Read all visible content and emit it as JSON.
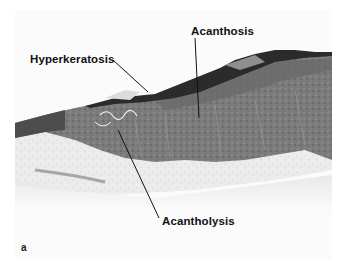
{
  "figure": {
    "panel_letter": "a",
    "labels": {
      "acanthosis": "Acanthosis",
      "hyperkeratosis": "Hyperkeratosis",
      "acantholysis": "Acantholysis"
    },
    "colors": {
      "background": "#ffffff",
      "dermis": "#e6e6e6",
      "epidermis": "#6f6f6f",
      "stratum_corneum": "#2a2a2a",
      "label_text": "#111111"
    }
  }
}
